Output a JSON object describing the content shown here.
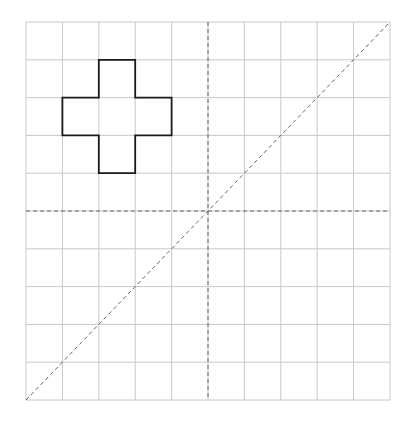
{
  "diagram": {
    "type": "grid-symmetry",
    "grid": {
      "cols": 10,
      "rows": 10,
      "x0": 26,
      "y0": 22,
      "x1": 390,
      "y1": 400,
      "line_color": "#c8c8c8"
    },
    "axes": {
      "vertical_center": {
        "style": "dashed",
        "color": "#666666"
      },
      "horizontal_center": {
        "style": "dashed",
        "color": "#666666"
      },
      "diagonal": {
        "from": "bottom-left",
        "to": "top-right",
        "style": "dashed",
        "color": "#666666"
      }
    },
    "shape": {
      "name": "cross",
      "color": "#1a1a1a",
      "cells": [
        [
          2,
          1
        ],
        [
          1,
          2
        ],
        [
          2,
          2
        ],
        [
          3,
          2
        ],
        [
          2,
          3
        ]
      ]
    }
  }
}
